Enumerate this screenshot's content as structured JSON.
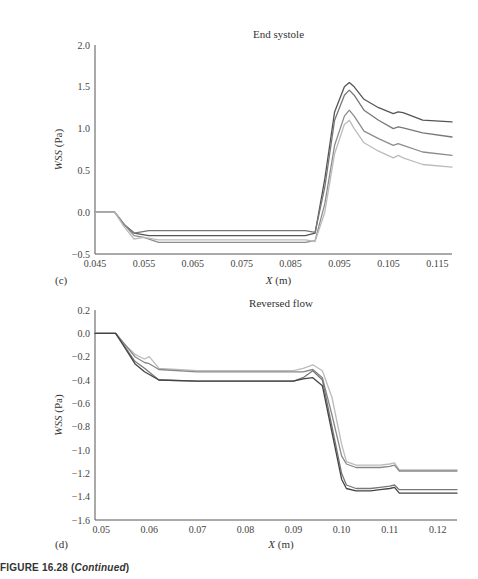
{
  "chart_data": [
    {
      "type": "line",
      "panel": "(c)",
      "title": "End systole",
      "xlabel": "X (m)",
      "ylabel": "WSS (Pa)",
      "xlim": [
        0.045,
        0.118
      ],
      "ylim": [
        -0.5,
        2.0
      ],
      "xticks": [
        "0.045",
        "0.055",
        "0.065",
        "0.075",
        "0.085",
        "0.095",
        "0.105",
        "0.115"
      ],
      "yticks": [
        "2.0",
        "1.5",
        "1.0",
        "0.5",
        "0.0",
        "-0.5"
      ],
      "grid": false,
      "legend": "none",
      "series": [
        {
          "name": "series 1 (darkest)",
          "color": "#555555",
          "x": [
            0.045,
            0.049,
            0.051,
            0.053,
            0.056,
            0.07,
            0.088,
            0.09,
            0.092,
            0.094,
            0.096,
            0.097,
            0.098,
            0.1,
            0.103,
            0.106,
            0.107,
            0.108,
            0.112,
            0.118
          ],
          "y": [
            0.0,
            0.0,
            -0.15,
            -0.25,
            -0.28,
            -0.28,
            -0.28,
            -0.25,
            0.4,
            1.2,
            1.5,
            1.55,
            1.5,
            1.35,
            1.25,
            1.18,
            1.2,
            1.19,
            1.1,
            1.08
          ]
        },
        {
          "name": "series 2",
          "color": "#777777",
          "x": [
            0.045,
            0.049,
            0.051,
            0.053,
            0.056,
            0.07,
            0.088,
            0.09,
            0.092,
            0.094,
            0.096,
            0.097,
            0.098,
            0.1,
            0.103,
            0.106,
            0.107,
            0.108,
            0.112,
            0.118
          ],
          "y": [
            0.0,
            0.0,
            -0.15,
            -0.25,
            -0.22,
            -0.22,
            -0.22,
            -0.24,
            0.3,
            1.1,
            1.4,
            1.46,
            1.4,
            1.22,
            1.1,
            1.0,
            1.02,
            1.01,
            0.95,
            0.9
          ]
        },
        {
          "name": "series 3",
          "color": "#8c8c8c",
          "x": [
            0.045,
            0.049,
            0.051,
            0.053,
            0.055,
            0.058,
            0.07,
            0.088,
            0.09,
            0.092,
            0.094,
            0.096,
            0.097,
            0.098,
            0.1,
            0.103,
            0.106,
            0.107,
            0.108,
            0.112,
            0.118
          ],
          "y": [
            0.0,
            0.0,
            -0.15,
            -0.28,
            -0.3,
            -0.36,
            -0.36,
            -0.36,
            -0.34,
            0.1,
            0.8,
            1.15,
            1.22,
            1.15,
            0.97,
            0.88,
            0.8,
            0.82,
            0.8,
            0.72,
            0.68
          ]
        },
        {
          "name": "series 4 (lightest)",
          "color": "#bbbbbb",
          "x": [
            0.045,
            0.049,
            0.051,
            0.053,
            0.055,
            0.058,
            0.07,
            0.088,
            0.09,
            0.092,
            0.094,
            0.096,
            0.097,
            0.098,
            0.1,
            0.103,
            0.106,
            0.107,
            0.108,
            0.112,
            0.118
          ],
          "y": [
            0.0,
            0.0,
            -0.18,
            -0.32,
            -0.3,
            -0.33,
            -0.33,
            -0.33,
            -0.35,
            0.0,
            0.7,
            1.05,
            1.1,
            1.0,
            0.83,
            0.73,
            0.65,
            0.68,
            0.65,
            0.57,
            0.54
          ]
        }
      ]
    },
    {
      "type": "line",
      "panel": "(d)",
      "title": "Reversed flow",
      "xlabel": "X (m)",
      "ylabel": "WSS (Pa)",
      "xlim": [
        0.0487,
        0.124
      ],
      "ylim": [
        -1.6,
        0.2
      ],
      "xticks": [
        "0.05",
        "0.06",
        "0.07",
        "0.08",
        "0.09",
        "0.10",
        "0.11",
        "0.12"
      ],
      "yticks": [
        "0.2",
        "0.0",
        "-0.2",
        "-0.4",
        "-0.6",
        "-0.8",
        "-1.0",
        "-1.2",
        "-1.4",
        "-1.6"
      ],
      "grid": false,
      "legend": "none",
      "series": [
        {
          "name": "series 1 (lightest)",
          "color": "#bbbbbb",
          "x": [
            0.0487,
            0.053,
            0.055,
            0.057,
            0.059,
            0.06,
            0.062,
            0.07,
            0.09,
            0.092,
            0.094,
            0.096,
            0.098,
            0.1,
            0.101,
            0.103,
            0.106,
            0.108,
            0.11,
            0.111,
            0.112,
            0.124
          ],
          "y": [
            0.0,
            0.0,
            -0.1,
            -0.18,
            -0.22,
            -0.2,
            -0.3,
            -0.32,
            -0.32,
            -0.3,
            -0.27,
            -0.32,
            -0.55,
            -0.95,
            -1.1,
            -1.13,
            -1.13,
            -1.13,
            -1.12,
            -1.11,
            -1.17,
            -1.17
          ]
        },
        {
          "name": "series 2",
          "color": "#888888",
          "x": [
            0.0487,
            0.053,
            0.055,
            0.057,
            0.059,
            0.06,
            0.062,
            0.07,
            0.09,
            0.092,
            0.094,
            0.096,
            0.098,
            0.1,
            0.101,
            0.103,
            0.106,
            0.108,
            0.11,
            0.111,
            0.112,
            0.124
          ],
          "y": [
            0.0,
            0.0,
            -0.1,
            -0.2,
            -0.25,
            -0.26,
            -0.31,
            -0.33,
            -0.33,
            -0.33,
            -0.31,
            -0.38,
            -0.7,
            -1.05,
            -1.12,
            -1.15,
            -1.15,
            -1.15,
            -1.14,
            -1.13,
            -1.18,
            -1.18
          ]
        },
        {
          "name": "series 3",
          "color": "#777777",
          "x": [
            0.0487,
            0.053,
            0.055,
            0.057,
            0.059,
            0.062,
            0.07,
            0.09,
            0.092,
            0.094,
            0.096,
            0.098,
            0.1,
            0.101,
            0.103,
            0.106,
            0.108,
            0.11,
            0.111,
            0.112,
            0.124
          ],
          "y": [
            0.0,
            0.0,
            -0.12,
            -0.24,
            -0.3,
            -0.4,
            -0.41,
            -0.41,
            -0.38,
            -0.32,
            -0.4,
            -0.8,
            -1.2,
            -1.3,
            -1.33,
            -1.33,
            -1.32,
            -1.31,
            -1.3,
            -1.34,
            -1.34
          ]
        },
        {
          "name": "series 4 (darkest)",
          "color": "#444444",
          "x": [
            0.0487,
            0.053,
            0.055,
            0.057,
            0.059,
            0.062,
            0.07,
            0.09,
            0.092,
            0.094,
            0.096,
            0.098,
            0.1,
            0.101,
            0.103,
            0.106,
            0.108,
            0.11,
            0.111,
            0.112,
            0.124
          ],
          "y": [
            0.0,
            0.0,
            -0.13,
            -0.26,
            -0.33,
            -0.4,
            -0.41,
            -0.41,
            -0.39,
            -0.38,
            -0.45,
            -0.85,
            -1.25,
            -1.33,
            -1.35,
            -1.35,
            -1.34,
            -1.33,
            -1.32,
            -1.37,
            -1.37
          ]
        }
      ]
    }
  ],
  "caption": {
    "prefix": "FIGURE 16.28 (",
    "italic": "Continued",
    "suffix": ")"
  }
}
